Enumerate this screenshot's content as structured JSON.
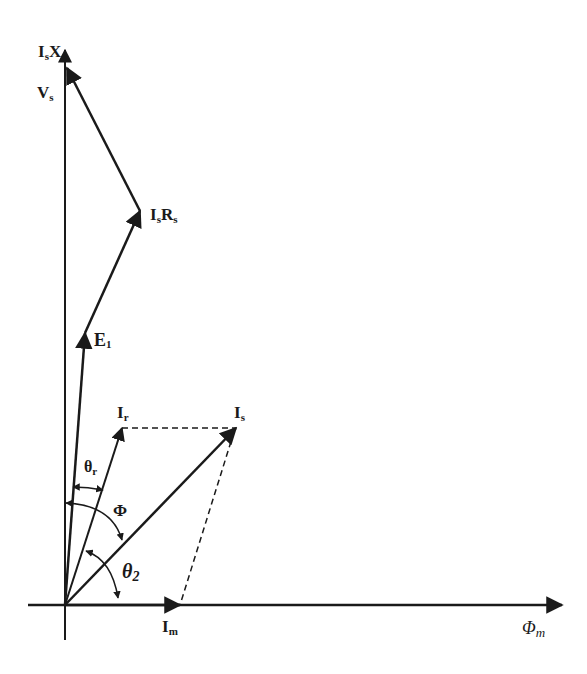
{
  "diagram": {
    "type": "phasor-diagram",
    "origin": [
      65,
      605
    ],
    "axes": {
      "horizontal": {
        "label": "Φ",
        "label_sub": "m",
        "from": [
          28,
          605
        ],
        "to": [
          562,
          605
        ]
      },
      "vertical": {
        "from": [
          65,
          640
        ],
        "to": [
          65,
          48
        ]
      }
    },
    "phasors": [
      {
        "id": "Im",
        "label": "I",
        "label_sub": "m",
        "from": [
          65,
          605
        ],
        "to": [
          180,
          605
        ]
      },
      {
        "id": "Is",
        "label": "I",
        "label_sub": "s",
        "from": [
          65,
          605
        ],
        "to": [
          236,
          428
        ]
      },
      {
        "id": "Ir",
        "label": "I",
        "label_sub": "r",
        "from": [
          65,
          605
        ],
        "to": [
          122,
          428
        ]
      },
      {
        "id": "E1",
        "label": "E",
        "label_sub": "1",
        "from": [
          65,
          605
        ],
        "to": [
          85,
          333
        ]
      },
      {
        "id": "IsRs",
        "label": "I",
        "label_sub": "s",
        "label2": "R",
        "label2_sub": "s",
        "from": [
          85,
          333
        ],
        "to": [
          140,
          211
        ]
      },
      {
        "id": "IsXs",
        "label": "I",
        "label_sub": "s",
        "label2": "X",
        "label2_sub": "s",
        "from": [
          140,
          211
        ],
        "to": [
          67,
          67
        ]
      }
    ],
    "dashed_lines": [
      {
        "from": [
          122,
          428
        ],
        "to": [
          236,
          428
        ]
      },
      {
        "from": [
          236,
          428
        ],
        "to": [
          180,
          605
        ]
      }
    ],
    "angles": [
      {
        "id": "theta_r",
        "label": "θ",
        "label_sub": "r"
      },
      {
        "id": "phi",
        "label": "Φ"
      },
      {
        "id": "theta_2",
        "label": "θ",
        "label_sub": "2"
      }
    ],
    "labels": {
      "vs": {
        "main": "V",
        "sub": "s"
      },
      "isxs": {
        "main1": "I",
        "sub1": "s",
        "main2": "X",
        "sub2": "s"
      },
      "isrs": {
        "main1": "I",
        "sub1": "s",
        "main2": "R",
        "sub2": "s"
      },
      "e1": {
        "main": "E",
        "sub": "1"
      },
      "ir": {
        "main": "I",
        "sub": "r"
      },
      "is": {
        "main": "I",
        "sub": "s"
      },
      "im": {
        "main": "I",
        "sub": "m"
      },
      "phim": {
        "main": "Φ",
        "sub": "m"
      },
      "theta_r": {
        "main": "θ",
        "sub": "r"
      },
      "phi": {
        "main": "Φ"
      },
      "theta_2": {
        "main": "θ",
        "sub": "2"
      }
    },
    "colors": {
      "stroke": "#1a1a1a",
      "background": "#ffffff"
    }
  }
}
